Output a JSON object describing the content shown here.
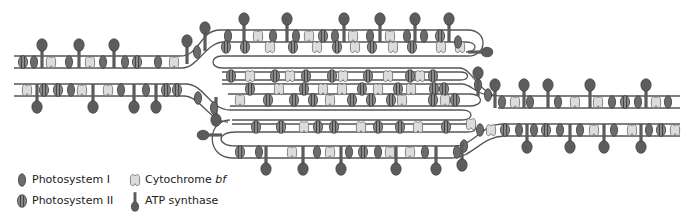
{
  "figure": {
    "type": "thylakoid membrane diagram"
  },
  "colors": {
    "membrane": "#555555",
    "photosystem_I": "#6b6b6b",
    "photosystem_II": "#7a7a7a",
    "photosystem_II_stripe": "#3e3e3e",
    "cytochrome_bf": "#d9d9d9",
    "atp_synthase": "#5c5c5c"
  },
  "legend": {
    "items": [
      {
        "icon": "photosystem-i-icon",
        "label": "Photosystem I"
      },
      {
        "icon": "photosystem-ii-icon",
        "label": "Photosystem II"
      },
      {
        "icon": "cytochrome-bf-icon",
        "label_prefix": "Cytochrome ",
        "label_italic": "bf"
      },
      {
        "icon": "atp-synthase-icon",
        "label": "ATP synthase"
      }
    ]
  }
}
